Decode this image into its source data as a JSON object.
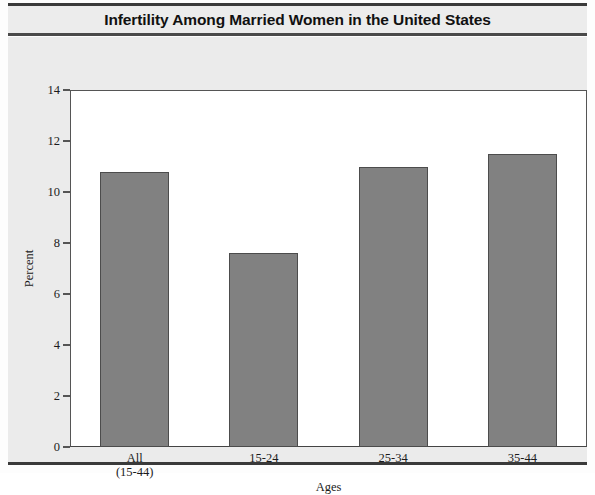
{
  "chart_data": {
    "type": "bar",
    "title": "Infertility Among Married Women in the United States",
    "xlabel": "Ages",
    "ylabel": "Percent",
    "categories": [
      "All\n(15-44)",
      "15-24",
      "25-34",
      "35-44"
    ],
    "category_labels": [
      {
        "line1": "All",
        "line2": "(15-44)"
      },
      {
        "line1": "15-24",
        "line2": ""
      },
      {
        "line1": "25-34",
        "line2": ""
      },
      {
        "line1": "35-44",
        "line2": ""
      }
    ],
    "values": [
      10.8,
      7.6,
      11.0,
      11.5
    ],
    "ylim": [
      0,
      14
    ],
    "yticks": [
      0,
      2,
      4,
      6,
      8,
      10,
      12,
      14
    ],
    "ytick_labels": [
      "0",
      "2",
      "4",
      "6",
      "8",
      "10",
      "12",
      "14"
    ],
    "grid": false,
    "legend": false,
    "bar_color": "#818181",
    "bar_edge_color": "#4c4c4c",
    "plot_background": "#ffffff",
    "figure_background": "#ebebeb",
    "text_color": "#1b1b1b"
  },
  "figure": {
    "title": "Infertility Among Married Women in the United States"
  }
}
